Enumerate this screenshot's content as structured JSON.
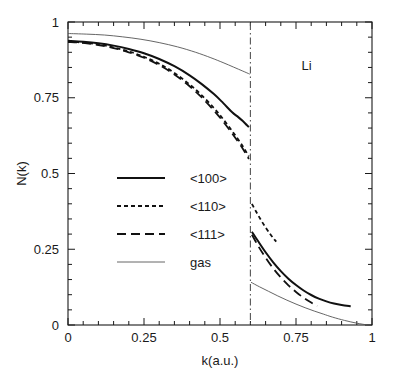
{
  "chart_data": {
    "type": "line",
    "title": "",
    "subtitle": "",
    "xlabel": "k(a.u.)",
    "ylabel": "N(k)",
    "xlim": [
      0,
      1
    ],
    "ylim": [
      0,
      1
    ],
    "grid": false,
    "legend_position": "center-left",
    "x_ticks": [
      0,
      0.25,
      0.5,
      0.75,
      1
    ],
    "x_tick_labels": [
      "0",
      "0.25",
      "0.5",
      "0.75",
      "1"
    ],
    "x_minor_tick_count": 4,
    "y_ticks": [
      0,
      0.25,
      0.5,
      0.75,
      1
    ],
    "y_tick_labels": [
      "0",
      "0.25",
      "0.5",
      "0.75",
      "1"
    ],
    "y_minor_tick_count": 4,
    "annotations": [
      {
        "text": "Li",
        "x": 0.785,
        "y": 0.855
      }
    ],
    "fermi_line": {
      "x": 0.6,
      "style": "dash-dot",
      "color": "#555555"
    },
    "series": [
      {
        "name": "<100>",
        "style": "solid",
        "width": 2.0,
        "color": "#111111",
        "segments": [
          {
            "branch": "below-fermi",
            "points": [
              [
                0.0,
                0.938
              ],
              [
                0.05,
                0.935
              ],
              [
                0.1,
                0.93
              ],
              [
                0.15,
                0.922
              ],
              [
                0.2,
                0.911
              ],
              [
                0.25,
                0.897
              ],
              [
                0.3,
                0.878
              ],
              [
                0.35,
                0.854
              ],
              [
                0.4,
                0.824
              ],
              [
                0.44,
                0.795
              ],
              [
                0.48,
                0.762
              ],
              [
                0.51,
                0.733
              ],
              [
                0.54,
                0.702
              ],
              [
                0.56,
                0.686
              ],
              [
                0.575,
                0.673
              ],
              [
                0.588,
                0.66
              ],
              [
                0.595,
                0.653
              ]
            ]
          },
          {
            "branch": "above-fermi",
            "points": [
              [
                0.605,
                0.308
              ],
              [
                0.625,
                0.277
              ],
              [
                0.65,
                0.24
              ],
              [
                0.675,
                0.207
              ],
              [
                0.7,
                0.178
              ],
              [
                0.725,
                0.153
              ],
              [
                0.75,
                0.132
              ],
              [
                0.775,
                0.114
              ],
              [
                0.8,
                0.099
              ],
              [
                0.825,
                0.087
              ],
              [
                0.85,
                0.078
              ],
              [
                0.875,
                0.071
              ],
              [
                0.9,
                0.066
              ],
              [
                0.93,
                0.062
              ]
            ]
          }
        ]
      },
      {
        "name": "<110>",
        "style": "dashed-short",
        "width": 1.8,
        "color": "#111111",
        "segments": [
          {
            "branch": "below-fermi",
            "points": [
              [
                0.0,
                0.935
              ],
              [
                0.05,
                0.932
              ],
              [
                0.1,
                0.926
              ],
              [
                0.15,
                0.916
              ],
              [
                0.2,
                0.903
              ],
              [
                0.25,
                0.885
              ],
              [
                0.3,
                0.862
              ],
              [
                0.35,
                0.832
              ],
              [
                0.4,
                0.794
              ],
              [
                0.44,
                0.758
              ],
              [
                0.48,
                0.716
              ],
              [
                0.51,
                0.68
              ],
              [
                0.54,
                0.64
              ],
              [
                0.56,
                0.612
              ],
              [
                0.575,
                0.59
              ],
              [
                0.588,
                0.568
              ],
              [
                0.595,
                0.556
              ]
            ]
          },
          {
            "branch": "above-fermi",
            "points": [
              [
                0.605,
                0.4
              ],
              [
                0.62,
                0.372
              ],
              [
                0.635,
                0.346
              ],
              [
                0.65,
                0.322
              ],
              [
                0.665,
                0.3
              ],
              [
                0.675,
                0.287
              ],
              [
                0.685,
                0.275
              ]
            ]
          }
        ]
      },
      {
        "name": "<111>",
        "style": "dashed-long",
        "width": 1.8,
        "color": "#111111",
        "segments": [
          {
            "branch": "below-fermi",
            "points": [
              [
                0.0,
                0.934
              ],
              [
                0.05,
                0.931
              ],
              [
                0.1,
                0.924
              ],
              [
                0.15,
                0.914
              ],
              [
                0.2,
                0.9
              ],
              [
                0.25,
                0.882
              ],
              [
                0.3,
                0.858
              ],
              [
                0.35,
                0.827
              ],
              [
                0.4,
                0.788
              ],
              [
                0.44,
                0.751
              ],
              [
                0.48,
                0.708
              ],
              [
                0.51,
                0.672
              ],
              [
                0.54,
                0.632
              ],
              [
                0.56,
                0.604
              ],
              [
                0.575,
                0.582
              ],
              [
                0.588,
                0.56
              ],
              [
                0.595,
                0.548
              ]
            ]
          },
          {
            "branch": "above-fermi",
            "points": [
              [
                0.605,
                0.298
              ],
              [
                0.625,
                0.262
              ],
              [
                0.65,
                0.222
              ],
              [
                0.675,
                0.187
              ],
              [
                0.7,
                0.157
              ],
              [
                0.725,
                0.131
              ],
              [
                0.75,
                0.109
              ],
              [
                0.775,
                0.09
              ],
              [
                0.8,
                0.074
              ],
              [
                0.82,
                0.063
              ]
            ]
          }
        ]
      },
      {
        "name": "gas",
        "style": "solid-thin",
        "width": 0.9,
        "color": "#555555",
        "segments": [
          {
            "branch": "below-fermi",
            "points": [
              [
                0.0,
                0.962
              ],
              [
                0.06,
                0.96
              ],
              [
                0.12,
                0.957
              ],
              [
                0.18,
                0.951
              ],
              [
                0.24,
                0.943
              ],
              [
                0.3,
                0.932
              ],
              [
                0.36,
                0.918
              ],
              [
                0.42,
                0.9
              ],
              [
                0.47,
                0.882
              ],
              [
                0.51,
                0.866
              ],
              [
                0.545,
                0.851
              ],
              [
                0.575,
                0.838
              ],
              [
                0.598,
                0.828
              ]
            ]
          },
          {
            "branch": "above-fermi",
            "points": [
              [
                0.602,
                0.141
              ],
              [
                0.63,
                0.126
              ],
              [
                0.66,
                0.111
              ],
              [
                0.69,
                0.096
              ],
              [
                0.72,
                0.082
              ],
              [
                0.75,
                0.069
              ],
              [
                0.78,
                0.057
              ],
              [
                0.81,
                0.046
              ],
              [
                0.84,
                0.036
              ],
              [
                0.87,
                0.026
              ],
              [
                0.91,
                0.015
              ],
              [
                0.95,
                0.006
              ],
              [
                0.985,
                0.0
              ]
            ]
          }
        ]
      }
    ],
    "legend_entries": [
      {
        "label": "<100>",
        "style": "solid"
      },
      {
        "label": "<110>",
        "style": "dashed-short"
      },
      {
        "label": "<111>",
        "style": "dashed-long"
      },
      {
        "label": "gas",
        "style": "solid-thin"
      }
    ]
  }
}
